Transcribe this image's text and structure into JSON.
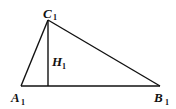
{
  "diagram": {
    "type": "triangle-with-altitude",
    "vertices": {
      "A": {
        "label": "A",
        "subscript": "1",
        "x": 21,
        "y": 86
      },
      "B": {
        "label": "B",
        "subscript": "1",
        "x": 160,
        "y": 86
      },
      "C": {
        "label": "C",
        "subscript": "1",
        "x": 48,
        "y": 20
      }
    },
    "altitude": {
      "label": "H",
      "subscript": "1",
      "from": "C",
      "foot_x": 48,
      "foot_y": 86
    },
    "stroke_color": "#111111",
    "background": "#ffffff"
  }
}
